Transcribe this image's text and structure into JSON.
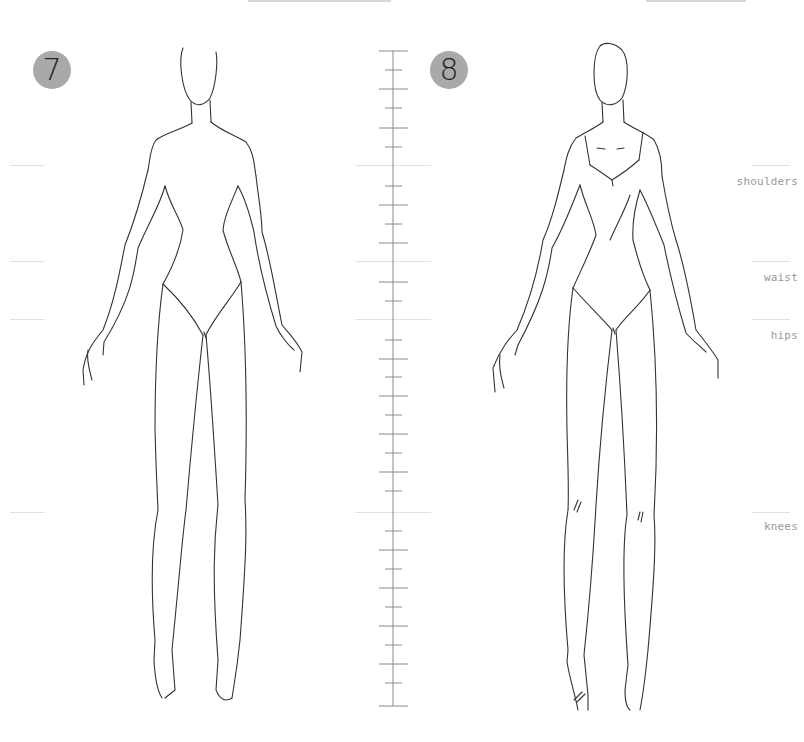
{
  "page": {
    "badges": [
      {
        "number": "7"
      },
      {
        "number": "8"
      }
    ],
    "guides": {
      "labels": [
        {
          "key": "shoulders",
          "label": "shoulders"
        },
        {
          "key": "waist",
          "label": "waist"
        },
        {
          "key": "hips",
          "label": "hips"
        },
        {
          "key": "knees",
          "label": "knees"
        }
      ]
    },
    "ruler": {
      "tick_count": 34
    },
    "colors": {
      "badge_fill": "#a9a9a9",
      "line": "#333333",
      "guide": "#e2e2e2",
      "label": "#9a9a9a"
    }
  }
}
